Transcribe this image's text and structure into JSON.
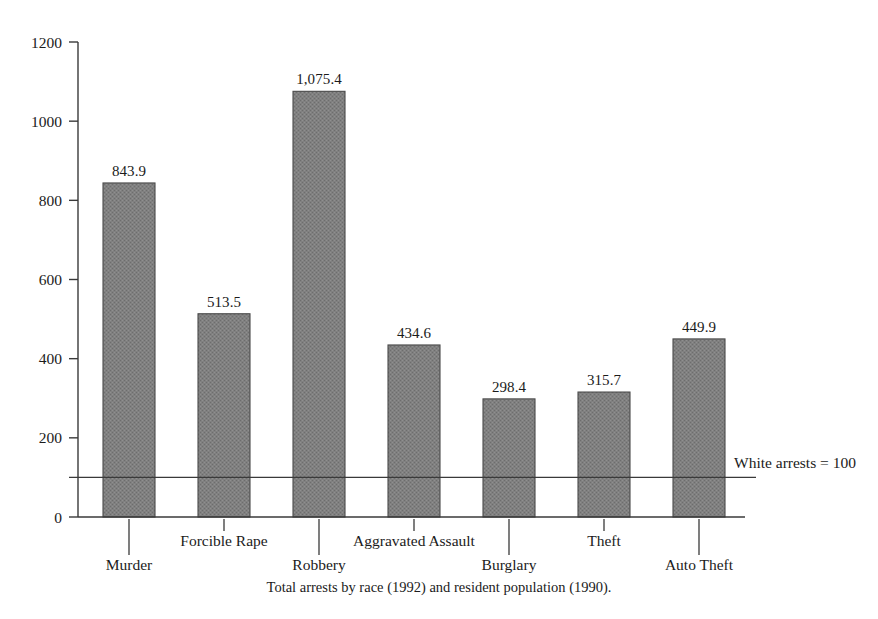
{
  "chart_data": {
    "type": "bar",
    "title": "",
    "subtitle": "",
    "caption": "Total arrests by race (1992) and resident population (1990).",
    "xlabel": "",
    "ylabel": "",
    "categories": [
      "Murder",
      "Forcible Rape",
      "Robbery",
      "Aggravated Assault",
      "Burglary",
      "Theft",
      "Auto Theft"
    ],
    "values": [
      843.9,
      513.5,
      1075.4,
      434.6,
      298.4,
      315.7,
      449.9
    ],
    "value_labels": [
      "843.9",
      "513.5",
      "1,075.4",
      "434.6",
      "298.4",
      "315.7",
      "449.9"
    ],
    "ylim": [
      0,
      1200
    ],
    "yticks": [
      0,
      200,
      400,
      600,
      800,
      1000,
      1200
    ],
    "ytick_labels": [
      "0",
      "200",
      "400",
      "600",
      "800",
      "1000",
      "1200"
    ],
    "grid": false,
    "legend": "none",
    "reference_line": {
      "value": 100,
      "label": "White arrests = 100"
    },
    "bar_color": "#7d7d7d",
    "bar_edge_color": "#4a4a4a",
    "axis_color": "#3a3a3a",
    "background_color": "#ffffff"
  },
  "annotations": {
    "reference_label": "White arrests = 100"
  },
  "caption": {
    "text": "Total arrests by race (1992) and resident population (1990)."
  }
}
